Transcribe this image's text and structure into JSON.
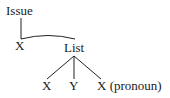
{
  "diagram": {
    "type": "tree",
    "nodes": {
      "root": {
        "label": "Issue"
      },
      "x_left": {
        "label": "X"
      },
      "list": {
        "label": "List"
      },
      "child_x": {
        "label": "X"
      },
      "child_y": {
        "label": "Y"
      },
      "child_x_pronoun": {
        "label": "X (pronoun)"
      }
    },
    "edges": [
      {
        "from": "root",
        "to": "x_left",
        "style": "straight"
      },
      {
        "from": "x_left",
        "to": "list",
        "style": "arc"
      },
      {
        "from": "list",
        "to": "child_x",
        "style": "straight"
      },
      {
        "from": "list",
        "to": "child_y",
        "style": "straight"
      },
      {
        "from": "list",
        "to": "child_x_pronoun",
        "style": "straight"
      }
    ],
    "colors": {
      "line": "#222222",
      "text": "#1a1a1a",
      "background": "#ffffff"
    }
  }
}
